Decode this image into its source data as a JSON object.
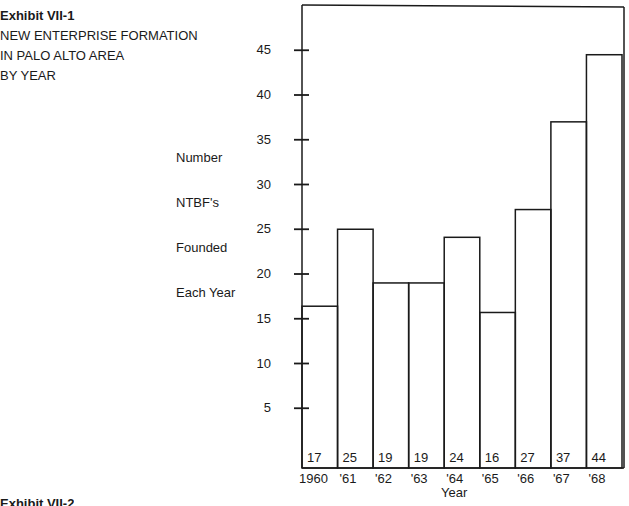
{
  "header": {
    "exhibit": "Exhibit VII-1",
    "lines": [
      "NEW ENTERPRISE FORMATION",
      "IN PALO ALTO AREA",
      "BY YEAR"
    ]
  },
  "ylabel_lines": [
    "Number",
    "NTBF's",
    "Founded",
    "Each Year"
  ],
  "footer": {
    "exhibit_partial": "Exhibit VII-2"
  },
  "chart_data": {
    "type": "bar",
    "title": "Exhibit VII-1 NEW ENTERPRISE FORMATION IN PALO ALTO AREA BY YEAR",
    "xlabel": "Year",
    "ylabel": "Number NTBF's Founded Each Year",
    "categories": [
      "1960",
      "'61",
      "'62",
      "'63",
      "'64",
      "'65",
      "'66",
      "'67",
      "'68"
    ],
    "values": [
      17,
      25,
      19,
      19,
      24,
      16,
      27,
      37,
      44
    ],
    "yticks": [
      5,
      10,
      15,
      20,
      25,
      30,
      35,
      40,
      45
    ],
    "ylim": [
      0,
      50
    ],
    "grid": false,
    "legend": "none",
    "data_labels_position": "inside-bottom",
    "bar_style": "outlined, no fill, adjacent"
  }
}
